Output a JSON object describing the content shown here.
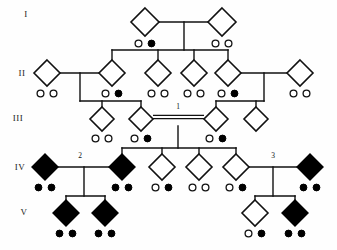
{
  "figure": {
    "symbol_shape": "diamond",
    "legend_meaning": {
      "open_diamond": "unaffected individual, sex unspecified",
      "filled_diamond": "affected individual, sex unspecified",
      "open_circle": "unaffected offspring marker",
      "filled_circle": "affected offspring marker",
      "double_line": "consanguineous mating"
    }
  },
  "generation_labels": [
    {
      "id": "gen-I",
      "text": "I",
      "x": 26,
      "y": 17
    },
    {
      "id": "gen-II",
      "text": "II",
      "x": 22,
      "y": 76
    },
    {
      "id": "gen-III",
      "text": "III",
      "x": 18,
      "y": 121
    },
    {
      "id": "gen-IV",
      "text": "IV",
      "x": 20,
      "y": 170
    },
    {
      "id": "gen-V",
      "text": "V",
      "x": 24,
      "y": 215
    }
  ],
  "mating_labels": [
    {
      "id": "mating-1",
      "text": "1",
      "x": 178,
      "y": 109
    },
    {
      "id": "mating-2",
      "text": "2",
      "x": 80,
      "y": 158
    },
    {
      "id": "mating-3",
      "text": "3",
      "x": 273,
      "y": 158
    }
  ],
  "individuals": [
    {
      "id": "I-1",
      "gen": "I",
      "cx": 145,
      "cy": 22,
      "r": 14,
      "state": "open",
      "circles": [
        "open",
        "filled"
      ]
    },
    {
      "id": "I-2",
      "gen": "I",
      "cx": 222,
      "cy": 22,
      "r": 14,
      "state": "open",
      "circles": [
        "open",
        "open"
      ]
    },
    {
      "id": "II-1",
      "gen": "II",
      "cx": 47,
      "cy": 73,
      "r": 13,
      "state": "open",
      "circles": [
        "open",
        "open"
      ]
    },
    {
      "id": "II-2",
      "gen": "II",
      "cx": 112,
      "cy": 73,
      "r": 13,
      "state": "open",
      "circles": [
        "open",
        "filled"
      ]
    },
    {
      "id": "II-3",
      "gen": "II",
      "cx": 158,
      "cy": 73,
      "r": 13,
      "state": "open",
      "circles": [
        "open",
        "open"
      ]
    },
    {
      "id": "II-4",
      "gen": "II",
      "cx": 194,
      "cy": 73,
      "r": 13,
      "state": "open",
      "circles": [
        "open",
        "open"
      ]
    },
    {
      "id": "II-5",
      "gen": "II",
      "cx": 228,
      "cy": 73,
      "r": 13,
      "state": "open",
      "circles": [
        "open",
        "filled"
      ]
    },
    {
      "id": "II-6",
      "gen": "II",
      "cx": 300,
      "cy": 73,
      "r": 13,
      "state": "open",
      "circles": [
        "open",
        "open"
      ]
    },
    {
      "id": "III-1",
      "gen": "III",
      "cx": 102,
      "cy": 119,
      "r": 12,
      "state": "open",
      "circles": [
        "open",
        "open"
      ]
    },
    {
      "id": "III-2",
      "gen": "III",
      "cx": 141,
      "cy": 119,
      "r": 12,
      "state": "open",
      "circles": [
        "open",
        "filled"
      ]
    },
    {
      "id": "III-3",
      "gen": "III",
      "cx": 216,
      "cy": 119,
      "r": 12,
      "state": "open",
      "circles": [
        "open",
        "filled"
      ]
    },
    {
      "id": "III-4",
      "gen": "III",
      "cx": 256,
      "cy": 119,
      "r": 12,
      "state": "open",
      "circles": []
    },
    {
      "id": "IV-1",
      "gen": "IV",
      "cx": 45,
      "cy": 167,
      "r": 13,
      "state": "filled",
      "circles": [
        "filled",
        "filled"
      ]
    },
    {
      "id": "IV-2",
      "gen": "IV",
      "cx": 122,
      "cy": 167,
      "r": 13,
      "state": "filled",
      "circles": [
        "filled",
        "filled"
      ]
    },
    {
      "id": "IV-3",
      "gen": "IV",
      "cx": 162,
      "cy": 167,
      "r": 13,
      "state": "open",
      "circles": [
        "open",
        "filled"
      ]
    },
    {
      "id": "IV-4",
      "gen": "IV",
      "cx": 199,
      "cy": 167,
      "r": 13,
      "state": "open",
      "circles": [
        "open",
        "open"
      ]
    },
    {
      "id": "IV-5",
      "gen": "IV",
      "cx": 236,
      "cy": 167,
      "r": 13,
      "state": "open",
      "circles": [
        "open",
        "filled"
      ]
    },
    {
      "id": "IV-6",
      "gen": "IV",
      "cx": 310,
      "cy": 167,
      "r": 13,
      "state": "filled",
      "circles": [
        "filled",
        "filled"
      ]
    },
    {
      "id": "V-1",
      "gen": "V",
      "cx": 66,
      "cy": 213,
      "r": 13,
      "state": "filled",
      "circles": [
        "filled",
        "filled"
      ]
    },
    {
      "id": "V-2",
      "gen": "V",
      "cx": 105,
      "cy": 213,
      "r": 13,
      "state": "filled",
      "circles": [
        "filled",
        "filled"
      ]
    },
    {
      "id": "V-3",
      "gen": "V",
      "cx": 255,
      "cy": 213,
      "r": 13,
      "state": "open",
      "circles": [
        "open",
        "filled"
      ]
    },
    {
      "id": "V-4",
      "gen": "V",
      "cx": 295,
      "cy": 213,
      "r": 13,
      "state": "filled",
      "circles": [
        "filled",
        "filled"
      ]
    }
  ],
  "mating_lines": [
    {
      "id": "m-I",
      "type": "single",
      "x1": 159,
      "x2": 208,
      "y": 22
    },
    {
      "id": "m-II-L",
      "type": "single",
      "x1": 60,
      "x2": 99,
      "y": 73
    },
    {
      "id": "m-II-R",
      "type": "single",
      "x1": 241,
      "x2": 287,
      "y": 73
    },
    {
      "id": "m-III",
      "type": "double",
      "x1": 153,
      "x2": 204,
      "y": 117
    },
    {
      "id": "m-IV-L",
      "type": "single",
      "x1": 58,
      "x2": 109,
      "y": 167
    },
    {
      "id": "m-IV-R",
      "type": "single",
      "x1": 249,
      "x2": 297,
      "y": 167
    }
  ],
  "sibships": [
    {
      "id": "sib-II",
      "parent_x": 184,
      "parent_y": 22,
      "bar_y": 50,
      "children_x": [
        112,
        158,
        194,
        228
      ],
      "child_y": 60
    },
    {
      "id": "sib-III-L",
      "parent_x": 80,
      "parent_y": 73,
      "bar_y": 101,
      "children_x": [
        102,
        141
      ],
      "child_y": 107
    },
    {
      "id": "sib-III-R",
      "parent_x": 264,
      "parent_y": 73,
      "bar_y": 101,
      "children_x": [
        216,
        256
      ],
      "child_y": 107
    },
    {
      "id": "sib-IV",
      "parent_x": 178,
      "parent_y": 126,
      "bar_y": 148,
      "children_x": [
        122,
        162,
        199,
        236
      ],
      "child_y": 154
    },
    {
      "id": "sib-V-L",
      "parent_x": 84,
      "parent_y": 167,
      "bar_y": 196,
      "children_x": [
        66,
        105
      ],
      "child_y": 200
    },
    {
      "id": "sib-V-R",
      "parent_x": 273,
      "parent_y": 167,
      "bar_y": 196,
      "children_x": [
        255,
        295
      ],
      "child_y": 200
    }
  ],
  "colors": {
    "stroke": "#111111",
    "affected_fill": "#000000",
    "unaffected_fill": "#ffffff",
    "background": "#ffffff"
  }
}
